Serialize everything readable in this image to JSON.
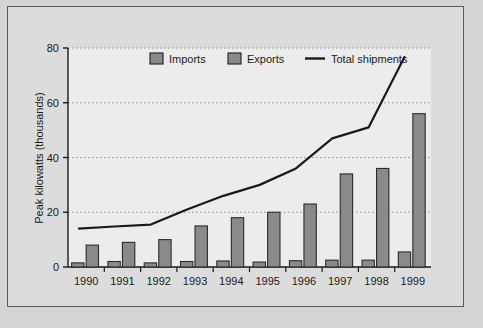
{
  "chart_data": {
    "type": "bar",
    "title": "",
    "xlabel": "",
    "ylabel": "Peak kilowatts (thousands)",
    "categories": [
      "1990",
      "1991",
      "1992",
      "1993",
      "1994",
      "1995",
      "1996",
      "1997",
      "1998",
      "1999"
    ],
    "series": [
      {
        "name": "Imports",
        "type": "bar",
        "color": "#8a8a8a",
        "values": [
          1.5,
          2.0,
          1.5,
          2.0,
          2.2,
          1.8,
          2.3,
          2.5,
          2.5,
          5.5
        ]
      },
      {
        "name": "Exports",
        "type": "bar",
        "color": "#8a8a8a",
        "values": [
          8,
          9,
          10,
          15,
          18,
          20,
          23,
          34,
          36,
          56
        ]
      },
      {
        "name": "Total shipments",
        "type": "line",
        "color": "#1a1a1a",
        "values": [
          14,
          14.8,
          15.5,
          21,
          26,
          30,
          36,
          47,
          51,
          77
        ]
      }
    ],
    "ylim": [
      0,
      80
    ],
    "yticks": [
      0,
      20,
      40,
      60,
      80
    ],
    "ytick_labels": [
      "0",
      "20",
      "40",
      "60",
      "80"
    ],
    "grid": "horizontal-dotted",
    "legend_position": "top-inside"
  },
  "legend": {
    "items": [
      {
        "label": "Imports",
        "marker": "swatch"
      },
      {
        "label": "Exports",
        "marker": "swatch"
      },
      {
        "label": "Total shipments",
        "marker": "line"
      }
    ]
  },
  "colors": {
    "bar_fill": "#8a8a8a",
    "bar_stroke": "#2b2b2b",
    "line": "#1a1a1a",
    "plot_background": "#ececec",
    "figure_background": "#d4d4d4",
    "axis": "#1a1a1a",
    "grid": "#8f8f8f"
  }
}
